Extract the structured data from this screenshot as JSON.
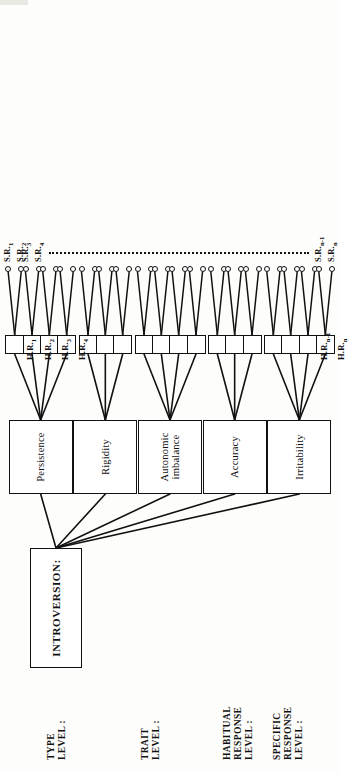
{
  "figure": {
    "orientation": "landscape figure rendered rotated 90 degrees on a portrait page",
    "ink_color": "#111111",
    "paper_color": "#fdfdfb"
  },
  "level_labels": [
    {
      "id": "type-level",
      "text": "TYPE\nLEVEL :"
    },
    {
      "id": "trait-level",
      "text": "TRAIT\nLEVEL :"
    },
    {
      "id": "habitual-level",
      "text": "HABITUAL\nRESPONSE\nLEVEL :"
    },
    {
      "id": "specific-level",
      "text": "SPECIFIC\nRESPONSE\nLEVEL :"
    }
  ],
  "type_node": {
    "label": "INTROVERSION:"
  },
  "traits": [
    {
      "id": "persistence",
      "label": "Persistence",
      "hr_count": 4
    },
    {
      "id": "rigidity",
      "label": "Rigidity",
      "hr_count": 3
    },
    {
      "id": "autonomic-imbalance",
      "label": "Autonomic\nimbalance",
      "hr_count": 4
    },
    {
      "id": "accuracy",
      "label": "Accuracy",
      "hr_count": 3
    },
    {
      "id": "irritability",
      "label": "Irritability",
      "hr_count": 4
    }
  ],
  "habitual_response_labels": [
    {
      "index": 0,
      "base": "H.R.",
      "sub": "1"
    },
    {
      "index": 1,
      "base": "H.R.",
      "sub": "2"
    },
    {
      "index": 2,
      "base": "H.R.",
      "sub": "3"
    },
    {
      "index": 3,
      "base": "H.R.",
      "sub": "4"
    },
    {
      "index": 16,
      "base": "H.R.",
      "sub": "n-1"
    },
    {
      "index": 17,
      "base": "H.R.",
      "sub": "n"
    }
  ],
  "specific_response_labels": [
    {
      "index": 0,
      "base": "S.R.",
      "sub": "1"
    },
    {
      "index": 1,
      "base": "S.R.",
      "sub": "2"
    },
    {
      "index": 2,
      "base": "S.R.",
      "sub": "3"
    },
    {
      "index": 3,
      "base": "S.R.",
      "sub": "4"
    },
    {
      "index": 34,
      "base": "S.R.",
      "sub": "n-1"
    },
    {
      "index": 35,
      "base": "S.R.",
      "sub": "n"
    }
  ],
  "counts": {
    "habitual_response_boxes": 18,
    "specific_response_circles_per_box": 2,
    "specific_response_circles_total": 36
  },
  "ellipsis": {
    "style": "dotted",
    "meaning": "continuation between S.R.4 and S.R.n-1"
  }
}
